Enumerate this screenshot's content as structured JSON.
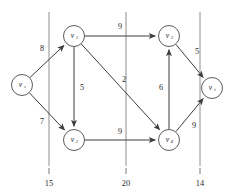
{
  "diagram": {
    "nodes": [
      {
        "id": "vs",
        "label": "v",
        "sub": "s",
        "cx": 22,
        "cy": 85,
        "r": 10.5
      },
      {
        "id": "v1",
        "label": "v",
        "sub": "1",
        "cx": 74,
        "cy": 36,
        "r": 10.5
      },
      {
        "id": "v2",
        "label": "v",
        "sub": "2",
        "cx": 74,
        "cy": 140,
        "r": 10.5
      },
      {
        "id": "v3",
        "label": "v",
        "sub": "3",
        "cx": 169,
        "cy": 36,
        "r": 10.5
      },
      {
        "id": "v4",
        "label": "v",
        "sub": "4",
        "cx": 169,
        "cy": 140,
        "r": 10.5
      },
      {
        "id": "vt",
        "label": "v",
        "sub": "t",
        "cx": 212,
        "cy": 88,
        "r": 10.5
      }
    ],
    "edges": [
      {
        "id": "vs-v1",
        "from": "vs",
        "to": "v1",
        "weight": "8",
        "lx": 42,
        "ly": 49
      },
      {
        "id": "vs-v2",
        "from": "vs",
        "to": "v2",
        "weight": "7",
        "lx": 42,
        "ly": 122
      },
      {
        "id": "v1-v3",
        "from": "v1",
        "to": "v3",
        "weight": "9",
        "lx": 120,
        "ly": 27
      },
      {
        "id": "v1-v2",
        "from": "v1",
        "to": "v2",
        "weight": "5",
        "lx": 82,
        "ly": 88
      },
      {
        "id": "v1-v4",
        "from": "v1",
        "to": "v4",
        "weight": "2",
        "lx": 124,
        "ly": 80
      },
      {
        "id": "v2-v4",
        "from": "v2",
        "to": "v4",
        "weight": "9",
        "lx": 120,
        "ly": 132
      },
      {
        "id": "v4-v3",
        "from": "v4",
        "to": "v3",
        "weight": "6",
        "lx": 161,
        "ly": 88
      },
      {
        "id": "v3-vt",
        "from": "v3",
        "to": "vt",
        "weight": "5",
        "lx": 197,
        "ly": 52
      },
      {
        "id": "v4-vt",
        "from": "v4",
        "to": "vt",
        "weight": "9",
        "lx": 194,
        "ly": 126
      }
    ],
    "cuts": [
      {
        "id": "cut-15",
        "x": 49,
        "y1": 12,
        "y2": 166,
        "label": "15",
        "lx": 49,
        "ly": 186
      },
      {
        "id": "cut-20",
        "x": 126,
        "y1": 12,
        "y2": 166,
        "label": "20",
        "lx": 126,
        "ly": 186
      },
      {
        "id": "cut-14",
        "x": 200,
        "y1": 12,
        "y2": 166,
        "label": "14",
        "lx": 200,
        "ly": 186
      }
    ]
  }
}
